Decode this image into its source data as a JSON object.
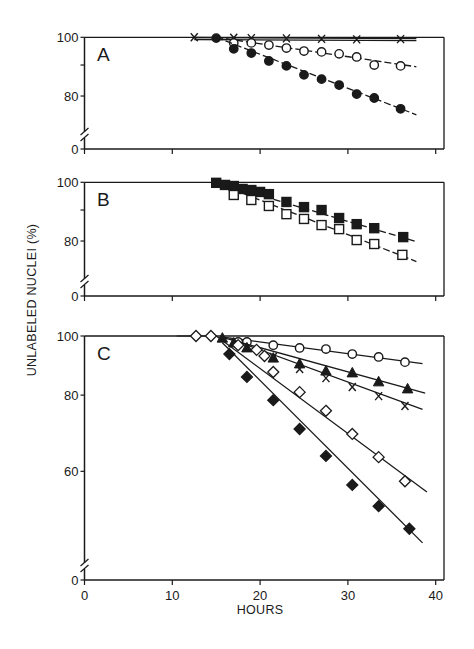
{
  "chart_data": [
    {
      "panel": "A",
      "type": "line",
      "scale": "log",
      "xlabel": "HOURS",
      "ylabel": "UNLABELED NUCLEI (%)",
      "xlim": [
        0,
        40
      ],
      "ylim_display": [
        0,
        100
      ],
      "yticks": [
        0,
        80,
        100
      ],
      "minor_yticks": [
        90
      ],
      "axis_break": true,
      "series": [
        {
          "name": "x",
          "marker": "x",
          "line": "double",
          "x": [
            12.5,
            17,
            19,
            23,
            27,
            31,
            36
          ],
          "y": [
            100,
            99.8,
            99.7,
            99.6,
            99.4,
            99.2,
            99.3
          ],
          "fit": {
            "x": [
              0,
              37.8
            ],
            "y": [
              100,
              99.2
            ]
          }
        },
        {
          "name": "open-circle",
          "marker": "circle-open",
          "line": "dash",
          "x": [
            17,
            19,
            21,
            23,
            25,
            27,
            29,
            31,
            33,
            36
          ],
          "y": [
            97.9,
            97.9,
            97.1,
            96.0,
            94.9,
            94.6,
            93.9,
            92.8,
            90.0,
            89.7
          ],
          "fit": {
            "x": [
              15,
              37.8
            ],
            "y": [
              100,
              89.4
            ]
          }
        },
        {
          "name": "filled-circle",
          "marker": "circle-filled",
          "line": "dash",
          "x": [
            15,
            17,
            19,
            21,
            23,
            25,
            27,
            29,
            31,
            33,
            36
          ],
          "y": [
            99.7,
            95.7,
            94.2,
            91.4,
            89.7,
            86.7,
            85.3,
            83.4,
            80.6,
            79.4,
            76.2
          ],
          "fit": {
            "x": [
              15,
              37.8
            ],
            "y": [
              100,
              74.5
            ]
          }
        }
      ]
    },
    {
      "panel": "B",
      "type": "line",
      "scale": "log",
      "xlim": [
        0,
        40
      ],
      "yticks": [
        0,
        80,
        100
      ],
      "minor_yticks": [
        90
      ],
      "axis_break": true,
      "series": [
        {
          "name": "filled-square",
          "marker": "square-filled",
          "line": "dash",
          "x": [
            15,
            16,
            17,
            18,
            19,
            20,
            21,
            23,
            25,
            27,
            29,
            31,
            33,
            36.3
          ],
          "y": [
            99.8,
            99.0,
            98.6,
            97.5,
            97.1,
            96.4,
            95.6,
            92.8,
            91.0,
            90.0,
            87.3,
            85.3,
            84.0,
            81.2
          ],
          "fit": {
            "x": [
              15,
              37.8
            ],
            "y": [
              100,
              79.8
            ]
          }
        },
        {
          "name": "open-square",
          "marker": "square-open",
          "line": "dash",
          "x": [
            17,
            19,
            21,
            23,
            25,
            27,
            29,
            31,
            33,
            36.2
          ],
          "y": [
            95.3,
            93.5,
            91.4,
            88.6,
            87.0,
            85.0,
            83.7,
            80.3,
            79.1,
            75.9
          ],
          "fit": {
            "x": [
              16,
              37.8
            ],
            "y": [
              98.5,
              74.0
            ]
          }
        }
      ]
    },
    {
      "panel": "C",
      "type": "line",
      "scale": "log",
      "xlim": [
        0,
        40
      ],
      "xticks": [
        0,
        10,
        20,
        30,
        40
      ],
      "yticks": [
        0,
        60,
        80,
        100
      ],
      "axis_break": true,
      "series": [
        {
          "name": "open-circle",
          "marker": "circle-open",
          "line": "solid",
          "x": [
            17.5,
            18.5,
            21.5,
            24.5,
            27.5,
            30.5,
            33.5,
            36.5
          ],
          "y": [
            97.8,
            97.8,
            96.6,
            95.6,
            95.2,
            93.4,
            92.4,
            90.6
          ],
          "fit": {
            "x": [
              16,
              38.5
            ],
            "y": [
              99.5,
              90.1
            ]
          }
        },
        {
          "name": "filled-triangle",
          "marker": "triangle-filled",
          "line": "solid",
          "x": [
            15.7,
            17,
            18.5,
            21.5,
            24.5,
            27.5,
            30.5,
            33.5,
            36.8
          ],
          "y": [
            99.2,
            97.4,
            95.6,
            92.0,
            90.0,
            87.6,
            87.0,
            84.1,
            81.9
          ],
          "fit": {
            "x": [
              15.7,
              38.8
            ],
            "y": [
              99.5,
              80.6
            ]
          }
        },
        {
          "name": "x",
          "marker": "x",
          "line": "solid",
          "x": [
            21.5,
            24.5,
            27.5,
            30.5,
            33.5,
            36.5
          ],
          "y": [
            92.4,
            88.3,
            85.3,
            82.5,
            79.7,
            76.8
          ],
          "fit": {
            "x": [
              16.5,
              38.5
            ],
            "y": [
              99.0,
              75.8
            ]
          }
        },
        {
          "name": "open-diamond",
          "marker": "diamond-open",
          "line": "solid",
          "x": [
            12.7,
            14.4,
            17.5,
            19.6,
            20.5,
            21.5,
            24.5,
            27.5,
            30.5,
            33.5,
            36.5
          ],
          "y": [
            100,
            100,
            96.6,
            94.9,
            92.7,
            87.3,
            80.9,
            75.4,
            69.1,
            63.3,
            57.8
          ],
          "fit": {
            "x": [
              15,
              39
            ],
            "y": [
              100,
              55.5
            ]
          }
        },
        {
          "name": "filled-diamond",
          "marker": "diamond-filled",
          "line": "solid",
          "x": [
            16.5,
            18.5,
            21.5,
            24.5,
            27.5,
            30.5,
            33.5,
            37
          ],
          "y": [
            93.4,
            85.7,
            78.5,
            70.4,
            63.6,
            57.0,
            52.6,
            48.3
          ],
          "fit": {
            "x": [
              15.7,
              38.5
            ],
            "y": [
              97.5,
              45.8
            ]
          }
        }
      ]
    }
  ],
  "figure": {
    "ylabel": "UNLABELED NUCLEI (%)",
    "xlabel": "HOURS",
    "panel_letters": [
      "A",
      "B",
      "C"
    ],
    "tick_labels": {
      "y100": "100",
      "y80": "80",
      "y60": "60",
      "y0": "0",
      "x": [
        "0",
        "10",
        "20",
        "30",
        "40"
      ]
    }
  }
}
